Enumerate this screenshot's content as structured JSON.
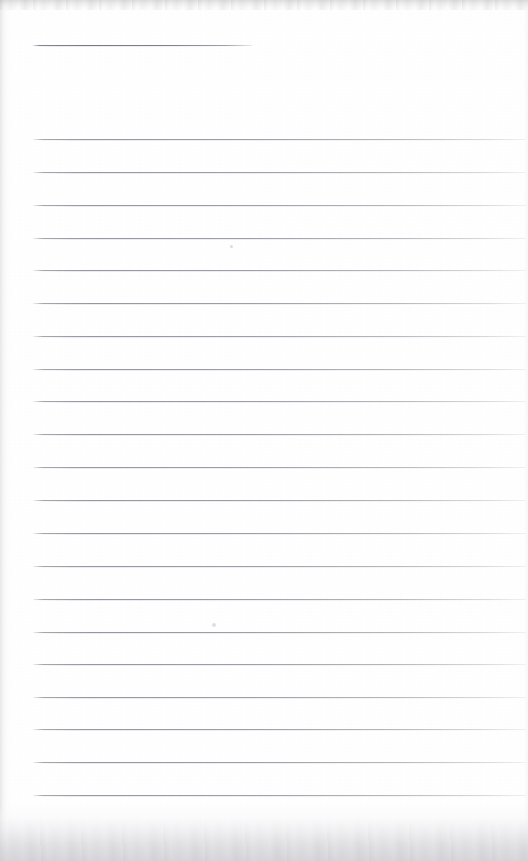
{
  "document": {
    "kind": "scanned-ruled-notebook-page",
    "title": "",
    "body_text": "",
    "page_width": 528,
    "page_height": 861,
    "paper_color": "#ffffff",
    "rule_color": "#93969e",
    "heading_rule_color": "#7a7d87",
    "edge_shadow_color": "#d4d4d8"
  },
  "heading_rule": {
    "label": "title-rule",
    "x": 33,
    "y": 45,
    "width": 219,
    "length_note": "short rule, ends at x=252"
  },
  "ruling": {
    "line_count": 21,
    "first_line_y": 139,
    "line_spacing": 32.8,
    "left_margin_x": 33,
    "right_end_x": 526,
    "lines": [
      {
        "index": 1,
        "y": 139,
        "x": 33,
        "width": 493
      },
      {
        "index": 2,
        "y": 172,
        "x": 33,
        "width": 493
      },
      {
        "index": 3,
        "y": 205,
        "x": 33,
        "width": 493
      },
      {
        "index": 4,
        "y": 238,
        "x": 33,
        "width": 493
      },
      {
        "index": 5,
        "y": 270,
        "x": 33,
        "width": 493
      },
      {
        "index": 6,
        "y": 303,
        "x": 33,
        "width": 493
      },
      {
        "index": 7,
        "y": 336,
        "x": 33,
        "width": 493
      },
      {
        "index": 8,
        "y": 369,
        "x": 33,
        "width": 493
      },
      {
        "index": 9,
        "y": 401,
        "x": 33,
        "width": 493
      },
      {
        "index": 10,
        "y": 434,
        "x": 33,
        "width": 493
      },
      {
        "index": 11,
        "y": 467,
        "x": 33,
        "width": 493
      },
      {
        "index": 12,
        "y": 500,
        "x": 33,
        "width": 493
      },
      {
        "index": 13,
        "y": 533,
        "x": 33,
        "width": 493
      },
      {
        "index": 14,
        "y": 566,
        "x": 33,
        "width": 493
      },
      {
        "index": 15,
        "y": 599,
        "x": 33,
        "width": 493
      },
      {
        "index": 16,
        "y": 632,
        "x": 33,
        "width": 493
      },
      {
        "index": 17,
        "y": 664,
        "x": 33,
        "width": 493
      },
      {
        "index": 18,
        "y": 697,
        "x": 33,
        "width": 493
      },
      {
        "index": 19,
        "y": 729,
        "x": 33,
        "width": 493
      },
      {
        "index": 20,
        "y": 762,
        "x": 33,
        "width": 493
      },
      {
        "index": 21,
        "y": 795,
        "x": 33,
        "width": 493
      }
    ]
  },
  "scan_artifacts": {
    "specks": [
      {
        "name": "speck-upper",
        "x": 230,
        "y": 245,
        "size": "small"
      },
      {
        "name": "speck-lower",
        "x": 212,
        "y": 623,
        "size": "small"
      }
    ],
    "edges": [
      {
        "name": "top-shadow",
        "height": 12
      },
      {
        "name": "left-shadow",
        "width": 11
      },
      {
        "name": "right-shadow",
        "width": 7
      },
      {
        "name": "bottom-shadow",
        "height": 58
      }
    ]
  }
}
